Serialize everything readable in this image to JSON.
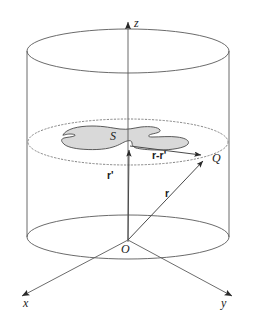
{
  "figure": {
    "type": "vector-geometry-diagram",
    "width": 259,
    "height": 321,
    "background_color": "#ffffff",
    "stroke_color": "#555555",
    "ink_color": "#1a1a1a",
    "surface_fill_color": "#d9d9d9",
    "surface_stroke_color": "#4a4a4a"
  },
  "axes": {
    "z": {
      "label": "z",
      "direction": "up",
      "arrow": "up-arrowhead",
      "tip": {
        "x": 128,
        "y": 14
      },
      "tail": {
        "x": 128,
        "y": 240
      }
    },
    "x": {
      "label": "x",
      "direction": "down-left",
      "arrow": "down-left-arrowhead",
      "tip": {
        "x": 14,
        "y": 300
      },
      "tail": {
        "x": 128,
        "y": 240
      }
    },
    "y": {
      "label": "y",
      "direction": "down-right",
      "arrow": "down-right-arrowhead",
      "tip": {
        "x": 240,
        "y": 300
      },
      "tail": {
        "x": 128,
        "y": 240
      }
    }
  },
  "origin": {
    "label": "O",
    "x": 128,
    "y": 240
  },
  "point_q": {
    "label": "Q",
    "x": 210,
    "y": 158
  },
  "surface": {
    "label": "S",
    "label_x": 112,
    "label_y": 134,
    "description": "irregular shaded planar region"
  },
  "cylinder": {
    "top_ellipse": {
      "cx": 128,
      "cy": 51,
      "rx": 101,
      "ry": 22
    },
    "bottom_ellipse": {
      "cx": 128,
      "cy": 237,
      "rx": 101,
      "ry": 22
    },
    "mid_ellipse": {
      "cx": 128,
      "cy": 142,
      "rx": 100,
      "ry": 23,
      "style": "dotted"
    }
  },
  "vectors": [
    {
      "name": "r-prime",
      "label": "r'",
      "label_x": 109,
      "label_y": 174,
      "from": {
        "x": 128,
        "y": 240
      },
      "to": {
        "x": 129,
        "y": 146
      },
      "description": "vector from origin O to source point on surface S"
    },
    {
      "name": "r",
      "label": "r",
      "label_x": 166,
      "label_y": 192,
      "from": {
        "x": 128,
        "y": 240
      },
      "to": {
        "x": 207,
        "y": 157
      },
      "description": "vector from origin O to field point Q"
    },
    {
      "name": "r-minus-r-prime",
      "label": "r-r'",
      "label_x": 154,
      "label_y": 155,
      "from": {
        "x": 129,
        "y": 146
      },
      "to": {
        "x": 206,
        "y": 155
      },
      "description": "separation vector from source point to field point Q"
    }
  ]
}
